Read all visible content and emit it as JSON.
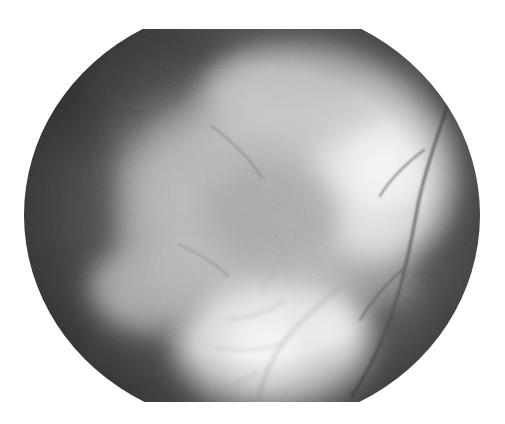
{
  "image": {
    "kind": "fundus-photograph",
    "modality": "Color fundus photography (rendered grayscale)",
    "anatomy": "Retina / posterior pole",
    "title": "",
    "caption": "",
    "label": "",
    "background_color": "#ffffff",
    "canvas": {
      "width": 505,
      "height": 424
    }
  },
  "aperture": {
    "shape": "circle-with-flat-top-and-bottom",
    "left": 24,
    "right": 479,
    "top": 29,
    "bottom": 402,
    "center_x": 252,
    "center_y": 215,
    "radius_x": 228,
    "radius_y": 212,
    "flat_top_y": 29,
    "flat_bottom_y": 402
  },
  "tones": {
    "outside_aperture": "#ffffff",
    "periphery_dark": "#3f3f3f",
    "periphery_mid": "#555555",
    "mid_gray": "#8a8a8a",
    "lesion_light": "#c8c8c8",
    "lesion_bright": "#e4e4e4",
    "hotspot_white": "#f6f6f6",
    "vessel_dark": "#4a4a4a",
    "vessel_faint": "#9a9a9a"
  },
  "regions": [
    {
      "name": "superior-temporal-dark-periphery",
      "cx": 110,
      "cy": 80,
      "rx": 120,
      "ry": 70,
      "tone": "#3c3c3c"
    },
    {
      "name": "nasal-dark-periphery",
      "cx": 55,
      "cy": 215,
      "rx": 70,
      "ry": 150,
      "tone": "#3a3a3a"
    },
    {
      "name": "inferior-nasal-dark-periphery",
      "cx": 110,
      "cy": 355,
      "rx": 110,
      "ry": 70,
      "tone": "#434343"
    },
    {
      "name": "superior-dark-band",
      "cx": 250,
      "cy": 48,
      "rx": 170,
      "ry": 32,
      "tone": "#454545"
    },
    {
      "name": "temporal-dark-crescent",
      "cx": 452,
      "cy": 200,
      "rx": 48,
      "ry": 150,
      "tone": "#494949"
    },
    {
      "name": "inferior-temporal-dark",
      "cx": 410,
      "cy": 360,
      "rx": 90,
      "ry": 60,
      "tone": "#4d4d4d"
    },
    {
      "name": "central-atrophic-plaque",
      "cx": 255,
      "cy": 205,
      "rx": 130,
      "ry": 115,
      "tone": "#b6b6b6"
    },
    {
      "name": "temporal-bright-lesion",
      "cx": 382,
      "cy": 172,
      "rx": 72,
      "ry": 88,
      "tone": "#e8e8e8"
    },
    {
      "name": "inferior-bright-lesion",
      "cx": 272,
      "cy": 345,
      "rx": 95,
      "ry": 62,
      "tone": "#ededed"
    },
    {
      "name": "superior-light-patch",
      "cx": 300,
      "cy": 95,
      "rx": 95,
      "ry": 50,
      "tone": "#c4c4c4"
    },
    {
      "name": "mid-nasal-light-patch",
      "cx": 145,
      "cy": 290,
      "rx": 55,
      "ry": 40,
      "tone": "#b0b0b0"
    },
    {
      "name": "macular-mottle",
      "cx": 270,
      "cy": 215,
      "rx": 70,
      "ry": 50,
      "tone": "#9e9e9e"
    }
  ],
  "hotspots": [
    {
      "name": "brightest-temporal",
      "cx": 386,
      "cy": 168,
      "r": 42,
      "tone": "#f7f7f7"
    },
    {
      "name": "brightest-inferior",
      "cx": 268,
      "cy": 350,
      "r": 40,
      "tone": "#f8f8f8"
    },
    {
      "name": "bright-inferior-right",
      "cx": 330,
      "cy": 330,
      "r": 30,
      "tone": "#ededed"
    }
  ],
  "vessels": [
    {
      "name": "temporal-arcade-main",
      "width": 3.2,
      "tone": "#4f4f4f",
      "path": "M 452 92 C 440 130, 425 168, 418 205 C 410 248, 402 288, 388 325 C 378 352, 366 375, 352 396"
    },
    {
      "name": "temporal-arcade-branch-upper",
      "width": 2.0,
      "tone": "#5b5b5b",
      "path": "M 424 150 C 408 162, 392 176, 380 196"
    },
    {
      "name": "temporal-arcade-branch-lower",
      "width": 2.0,
      "tone": "#595959",
      "path": "M 404 268 C 388 282, 372 300, 360 320"
    },
    {
      "name": "inferior-vessel-trunk",
      "width": 2.2,
      "tone": "#8e8e8e",
      "path": "M 338 288 C 318 306, 298 322, 282 344 C 270 362, 262 382, 258 400"
    },
    {
      "name": "inferior-vessel-branch-a",
      "width": 1.6,
      "tone": "#9a9a9a",
      "path": "M 284 302 C 268 312, 250 318, 228 320"
    },
    {
      "name": "inferior-vessel-branch-b",
      "width": 1.5,
      "tone": "#9e9e9e",
      "path": "M 282 344 C 262 350, 240 352, 216 348"
    },
    {
      "name": "inferior-vessel-branch-c",
      "width": 1.4,
      "tone": "#a4a4a4",
      "path": "M 258 372 C 240 382, 222 390, 206 396"
    },
    {
      "name": "central-faint-vessel",
      "width": 1.4,
      "tone": "#9c9c9c",
      "path": "M 300 232 C 286 252, 272 270, 262 292"
    },
    {
      "name": "nasal-faint-vessel",
      "width": 1.3,
      "tone": "#767676",
      "path": "M 178 244 C 196 252, 214 262, 228 276"
    },
    {
      "name": "superior-faint-vessel",
      "width": 1.3,
      "tone": "#6a6a6a",
      "path": "M 212 126 C 232 142, 250 158, 262 178"
    }
  ],
  "texture": {
    "grain_opacity": 0.3,
    "granularity": "fine halftone-like film grain",
    "vignette_strength": 0.72
  }
}
